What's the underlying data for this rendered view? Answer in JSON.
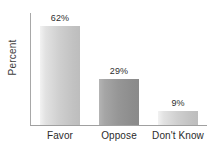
{
  "chart_data": {
    "type": "bar",
    "title": "",
    "xlabel": "",
    "ylabel": "Percent",
    "categories": [
      "Favor",
      "Oppose",
      "Don't Know"
    ],
    "values": [
      62,
      29,
      9
    ],
    "value_labels": [
      "62%",
      "29%",
      "9%"
    ],
    "ylim": [
      0,
      70
    ],
    "grid": false,
    "legend": null,
    "orientation": "vertical",
    "colors": {
      "bar_light": "#cfcfcf",
      "bar_dark": "#969696",
      "axis": "#a0a0a0",
      "text": "#2e2e2e",
      "background": "#ffffff"
    },
    "bar_styles": [
      "light",
      "dark",
      "light"
    ]
  }
}
